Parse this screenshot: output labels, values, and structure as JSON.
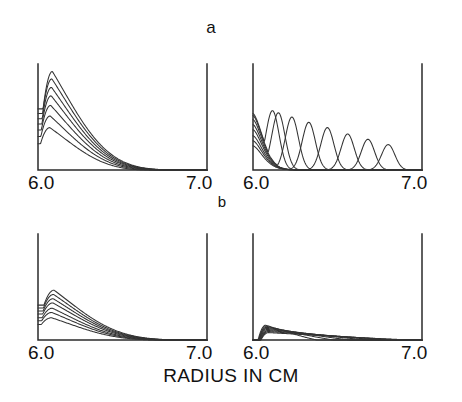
{
  "figure": {
    "panel_labels": [
      {
        "name": "a",
        "text": "a"
      },
      {
        "name": "b",
        "text": "b"
      }
    ],
    "xaxis_title": "RADIUS IN CM",
    "tick_labels": {
      "left": "6.0",
      "right": "7.0"
    },
    "ink_color": "#333333",
    "axis_color": "#2b2b2b",
    "background": "#ffffff"
  },
  "chart_data": {
    "type": "line",
    "title": "",
    "xlabel": "RADIUS IN CM",
    "ylabel": "",
    "xlim": [
      6.0,
      7.0
    ],
    "ylim": [
      0,
      1
    ],
    "grid": false,
    "legend": "none",
    "xticks": [
      6.0,
      7.0
    ],
    "xticklabels": [
      "6.0",
      "7.0"
    ],
    "panels": [
      {
        "id": "a-left",
        "group": "a",
        "position": "top-left",
        "description": "Family of 7 decaying single-hump radial profiles peaking near r=6.08 with monotonically decreasing amplitudes",
        "n_curves": 7,
        "series": [
          {
            "name": "t1",
            "peak_x": 6.085,
            "peak_y": 0.93,
            "tail_end_x": 6.82
          },
          {
            "name": "t2",
            "peak_x": 6.082,
            "peak_y": 0.86,
            "tail_end_x": 6.8
          },
          {
            "name": "t3",
            "peak_x": 6.08,
            "peak_y": 0.78,
            "tail_end_x": 6.78
          },
          {
            "name": "t4",
            "peak_x": 6.078,
            "peak_y": 0.7,
            "tail_end_x": 6.75
          },
          {
            "name": "t5",
            "peak_x": 6.075,
            "peak_y": 0.61,
            "tail_end_x": 6.72
          },
          {
            "name": "t6",
            "peak_x": 6.072,
            "peak_y": 0.51,
            "tail_end_x": 6.68
          },
          {
            "name": "t7",
            "peak_x": 6.07,
            "peak_y": 0.4,
            "tail_end_x": 6.62
          }
        ]
      },
      {
        "id": "a-right",
        "group": "a",
        "position": "top-right",
        "description": "Traveling pulse family: each successive curve rises at the left wall then propagates outward as a moving hump of decreasing height",
        "n_curves": 8,
        "series": [
          {
            "name": "t1",
            "peak_x": 6.115,
            "peak_y": 0.56
          },
          {
            "name": "t2",
            "peak_x": 6.15,
            "peak_y": 0.54
          },
          {
            "name": "t3",
            "peak_x": 6.23,
            "peak_y": 0.5
          },
          {
            "name": "t4",
            "peak_x": 6.33,
            "peak_y": 0.45
          },
          {
            "name": "t5",
            "peak_x": 6.44,
            "peak_y": 0.4
          },
          {
            "name": "t6",
            "peak_x": 6.56,
            "peak_y": 0.34
          },
          {
            "name": "t7",
            "peak_x": 6.68,
            "peak_y": 0.29
          },
          {
            "name": "t8",
            "peak_x": 6.8,
            "peak_y": 0.24
          }
        ]
      },
      {
        "id": "b-left",
        "group": "b",
        "position": "bottom-left",
        "description": "Family of 7 low-amplitude single-hump radial profiles, same shape as panel a-left at roughly half the height",
        "n_curves": 7,
        "series": [
          {
            "name": "t1",
            "peak_x": 6.095,
            "peak_y": 0.47,
            "tail_end_x": 6.86
          },
          {
            "name": "t2",
            "peak_x": 6.092,
            "peak_y": 0.43,
            "tail_end_x": 6.84
          },
          {
            "name": "t3",
            "peak_x": 6.09,
            "peak_y": 0.39,
            "tail_end_x": 6.82
          },
          {
            "name": "t4",
            "peak_x": 6.088,
            "peak_y": 0.35,
            "tail_end_x": 6.79
          },
          {
            "name": "t5",
            "peak_x": 6.085,
            "peak_y": 0.3,
            "tail_end_x": 6.76
          },
          {
            "name": "t6",
            "peak_x": 6.082,
            "peak_y": 0.26,
            "tail_end_x": 6.72
          },
          {
            "name": "t7",
            "peak_x": 6.08,
            "peak_y": 0.21,
            "tail_end_x": 6.68
          }
        ]
      },
      {
        "id": "b-right",
        "group": "b",
        "position": "bottom-right",
        "description": "Very low flat family: small spike at the left wall followed by long shallow ramps fanning out to the baseline",
        "n_curves": 8,
        "series": [
          {
            "name": "t1",
            "peak_x": 6.075,
            "peak_y": 0.14,
            "tail_end_x": 6.38
          },
          {
            "name": "t2",
            "peak_x": 6.078,
            "peak_y": 0.13,
            "tail_end_x": 6.48
          },
          {
            "name": "t3",
            "peak_x": 6.08,
            "peak_y": 0.12,
            "tail_end_x": 6.58
          },
          {
            "name": "t4",
            "peak_x": 6.082,
            "peak_y": 0.11,
            "tail_end_x": 6.68
          },
          {
            "name": "t5",
            "peak_x": 6.085,
            "peak_y": 0.1,
            "tail_end_x": 6.76
          },
          {
            "name": "t6",
            "peak_x": 6.088,
            "peak_y": 0.09,
            "tail_end_x": 6.84
          },
          {
            "name": "t7",
            "peak_x": 6.09,
            "peak_y": 0.08,
            "tail_end_x": 6.9
          },
          {
            "name": "t8",
            "peak_x": 6.092,
            "peak_y": 0.07,
            "tail_end_x": 6.95
          }
        ]
      }
    ]
  }
}
